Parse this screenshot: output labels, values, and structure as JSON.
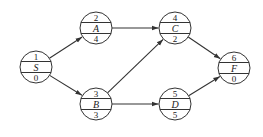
{
  "diagram": {
    "type": "activity-on-node network",
    "line_color": "#333333",
    "background": "#ffffff",
    "node_radius": 16,
    "nodes": [
      {
        "id": "S",
        "label": "S",
        "top": "1",
        "bottom": "0",
        "x": 36,
        "y": 67
      },
      {
        "id": "A",
        "label": "A",
        "top": "2",
        "bottom": "4",
        "x": 96,
        "y": 28
      },
      {
        "id": "B",
        "label": "B",
        "top": "3",
        "bottom": "3",
        "x": 96,
        "y": 104
      },
      {
        "id": "C",
        "label": "C",
        "top": "4",
        "bottom": "2",
        "x": 175,
        "y": 28
      },
      {
        "id": "D",
        "label": "D",
        "top": "5",
        "bottom": "5",
        "x": 175,
        "y": 104
      },
      {
        "id": "F",
        "label": "F",
        "top": "6",
        "bottom": "0",
        "x": 234,
        "y": 68
      }
    ],
    "edges": [
      {
        "from": "S",
        "to": "A"
      },
      {
        "from": "S",
        "to": "B"
      },
      {
        "from": "A",
        "to": "C"
      },
      {
        "from": "B",
        "to": "C"
      },
      {
        "from": "B",
        "to": "D"
      },
      {
        "from": "C",
        "to": "F"
      },
      {
        "from": "D",
        "to": "F"
      }
    ]
  }
}
